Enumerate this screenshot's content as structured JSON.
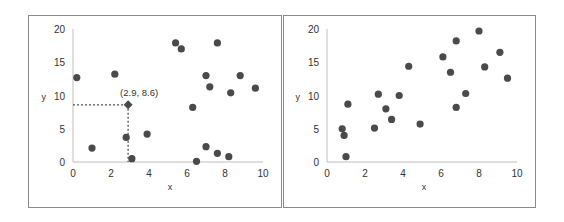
{
  "chart_data": [
    {
      "type": "scatter",
      "title": "",
      "xlabel": "x",
      "ylabel": "y",
      "xlim": [
        0,
        10
      ],
      "ylim": [
        0,
        20
      ],
      "xticks": [
        0,
        2,
        4,
        6,
        8,
        10
      ],
      "yticks": [
        0,
        5,
        10,
        15,
        20
      ],
      "grid": false,
      "marker_color": "#4a4a4a",
      "points": [
        [
          0.2,
          12.7
        ],
        [
          1.0,
          2.1
        ],
        [
          2.2,
          13.2
        ],
        [
          2.8,
          3.7
        ],
        [
          3.1,
          0.5
        ],
        [
          3.9,
          4.2
        ],
        [
          5.4,
          17.9
        ],
        [
          5.7,
          17.0
        ],
        [
          6.3,
          8.2
        ],
        [
          6.5,
          0.1
        ],
        [
          7.0,
          2.3
        ],
        [
          7.0,
          13.0
        ],
        [
          7.2,
          11.3
        ],
        [
          7.6,
          17.9
        ],
        [
          7.6,
          1.3
        ],
        [
          8.3,
          10.4
        ],
        [
          8.2,
          0.8
        ],
        [
          8.8,
          13.0
        ],
        [
          9.6,
          11.1
        ]
      ],
      "highlight": {
        "x": 2.9,
        "y": 8.6,
        "label": "(2.9, 8.6)",
        "marker": "diamond",
        "guides": "dotted"
      }
    },
    {
      "type": "scatter",
      "title": "",
      "xlabel": "x",
      "ylabel": "y",
      "xlim": [
        0,
        10
      ],
      "ylim": [
        0,
        20
      ],
      "xticks": [
        0,
        2,
        4,
        6,
        8,
        10
      ],
      "yticks": [
        0,
        5,
        10,
        15,
        20
      ],
      "grid": false,
      "marker_color": "#4a4a4a",
      "points": [
        [
          0.8,
          5.0
        ],
        [
          0.9,
          4.0
        ],
        [
          1.0,
          0.8
        ],
        [
          1.1,
          8.7
        ],
        [
          2.5,
          5.1
        ],
        [
          2.7,
          10.2
        ],
        [
          3.1,
          8.0
        ],
        [
          3.4,
          6.4
        ],
        [
          3.8,
          10.0
        ],
        [
          4.3,
          14.4
        ],
        [
          4.9,
          5.7
        ],
        [
          6.1,
          15.8
        ],
        [
          6.5,
          13.5
        ],
        [
          6.8,
          18.2
        ],
        [
          6.8,
          8.2
        ],
        [
          7.3,
          10.3
        ],
        [
          8.0,
          19.7
        ],
        [
          8.3,
          14.3
        ],
        [
          9.1,
          16.5
        ],
        [
          9.5,
          12.6
        ]
      ]
    }
  ]
}
